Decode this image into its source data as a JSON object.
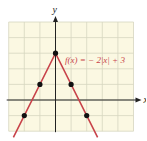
{
  "chart_data": {
    "type": "line",
    "title": "",
    "function_label": "f(x) = − 2|x| + 3",
    "xlabel": "x",
    "ylabel": "y",
    "xlim": [
      -3,
      5
    ],
    "ylim": [
      -2,
      5
    ],
    "grid": true,
    "series": [
      {
        "name": "f(x) = -2|x| + 3",
        "color": "#c8434a",
        "x": [
          -2.7,
          0,
          2.7
        ],
        "y": [
          -2.4,
          3,
          -2.4
        ]
      }
    ],
    "points": [
      {
        "x": -2,
        "y": -1
      },
      {
        "x": -1,
        "y": 1
      },
      {
        "x": 0,
        "y": 3
      },
      {
        "x": 1,
        "y": 1
      },
      {
        "x": 2,
        "y": -1
      }
    ]
  },
  "colors": {
    "grid_background": "#fbf8e2",
    "grid_lines": "#d6d6c0",
    "axes": "#222222",
    "curve": "#c8434a",
    "label": "#c8434a"
  }
}
